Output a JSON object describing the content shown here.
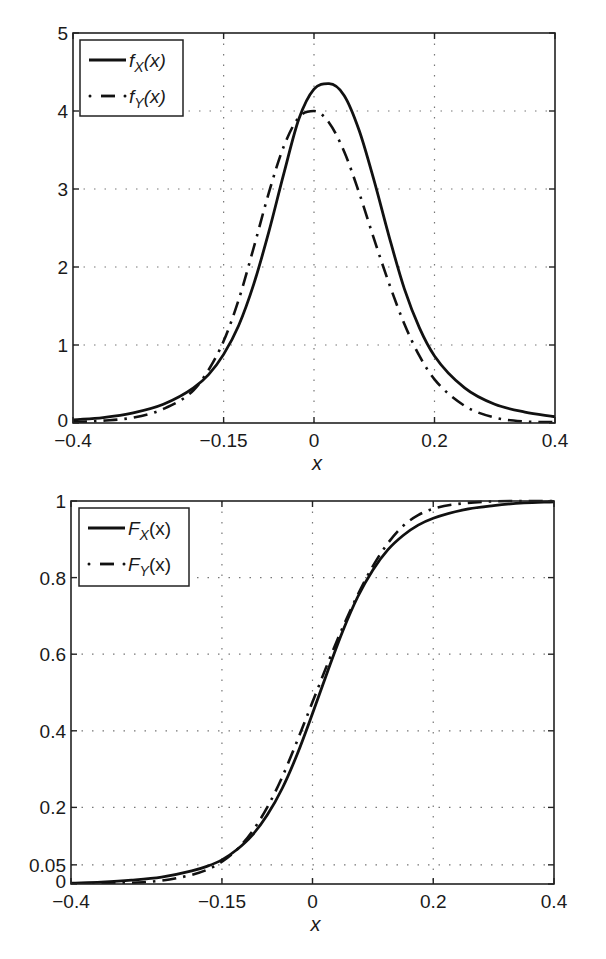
{
  "chart_data": [
    {
      "type": "line",
      "title": "",
      "xlabel": "x",
      "ylabel": "",
      "xlim": [
        -0.4,
        0.4
      ],
      "ylim": [
        0,
        5
      ],
      "xticks": [
        -0.4,
        -0.15,
        0,
        0.2,
        0.4
      ],
      "xtick_labels": [
        "−0.4",
        "−0.15",
        "0",
        "0.2",
        "0.4"
      ],
      "yticks": [
        0,
        1,
        2,
        3,
        4,
        5
      ],
      "ytick_labels": [
        "0",
        "1",
        "2",
        "3",
        "4",
        "5"
      ],
      "grid": true,
      "legend_position": "upper left",
      "x": [
        -0.4,
        -0.35,
        -0.3,
        -0.25,
        -0.2,
        -0.175,
        -0.15,
        -0.125,
        -0.1,
        -0.075,
        -0.05,
        -0.025,
        0,
        0.025,
        0.05,
        0.075,
        0.1,
        0.125,
        0.15,
        0.175,
        0.2,
        0.25,
        0.3,
        0.35,
        0.4
      ],
      "series": [
        {
          "name": "f_X(x)",
          "legend_label": "f",
          "legend_sub": "X",
          "legend_arg": "(x)",
          "style": "solid",
          "values": [
            0.04,
            0.07,
            0.13,
            0.24,
            0.45,
            0.62,
            0.88,
            1.25,
            1.78,
            2.45,
            3.2,
            3.9,
            4.28,
            4.35,
            4.2,
            3.75,
            3.1,
            2.38,
            1.72,
            1.22,
            0.86,
            0.45,
            0.24,
            0.14,
            0.08
          ]
        },
        {
          "name": "f_Y(x)",
          "legend_label": "f",
          "legend_sub": "Y",
          "legend_arg": "(x)",
          "style": "dash-dot",
          "values": [
            0.01,
            0.03,
            0.07,
            0.18,
            0.42,
            0.68,
            1.05,
            1.58,
            2.25,
            2.95,
            3.55,
            3.92,
            4.0,
            3.85,
            3.48,
            2.95,
            2.35,
            1.78,
            1.27,
            0.86,
            0.56,
            0.22,
            0.07,
            0.02,
            0.01
          ]
        }
      ]
    },
    {
      "type": "line",
      "title": "",
      "xlabel": "x",
      "ylabel": "",
      "xlim": [
        -0.4,
        0.4
      ],
      "ylim": [
        0,
        1
      ],
      "xticks": [
        -0.4,
        -0.15,
        0,
        0.2,
        0.4
      ],
      "xtick_labels": [
        "−0.4",
        "−0.15",
        "0",
        "0.2",
        "0.4"
      ],
      "yticks": [
        0,
        0.05,
        0.2,
        0.4,
        0.6,
        0.8,
        1
      ],
      "ytick_labels": [
        "0",
        "0.05",
        "0.2",
        "0.4",
        "0.6",
        "0.8",
        "1"
      ],
      "grid": true,
      "legend_position": "upper left",
      "x": [
        -0.4,
        -0.35,
        -0.3,
        -0.25,
        -0.2,
        -0.175,
        -0.15,
        -0.125,
        -0.1,
        -0.075,
        -0.05,
        -0.025,
        0,
        0.025,
        0.05,
        0.075,
        0.1,
        0.125,
        0.15,
        0.175,
        0.2,
        0.25,
        0.3,
        0.35,
        0.4
      ],
      "series": [
        {
          "name": "F_X(x)",
          "legend_label": "F",
          "legend_sub": "X",
          "legend_arg": "(x)",
          "style": "solid",
          "values": [
            0.002,
            0.005,
            0.01,
            0.018,
            0.034,
            0.046,
            0.063,
            0.09,
            0.127,
            0.18,
            0.25,
            0.34,
            0.445,
            0.555,
            0.66,
            0.75,
            0.82,
            0.873,
            0.91,
            0.937,
            0.955,
            0.977,
            0.988,
            0.995,
            0.998
          ]
        },
        {
          "name": "F_Y(x)",
          "legend_label": "F",
          "legend_sub": "Y",
          "legend_arg": "(x)",
          "style": "dash-dot",
          "values": [
            0.0,
            0.001,
            0.003,
            0.009,
            0.024,
            0.037,
            0.058,
            0.09,
            0.137,
            0.2,
            0.28,
            0.375,
            0.475,
            0.575,
            0.67,
            0.755,
            0.83,
            0.89,
            0.935,
            0.963,
            0.98,
            0.994,
            0.999,
            1.0,
            1.0
          ]
        }
      ]
    }
  ]
}
